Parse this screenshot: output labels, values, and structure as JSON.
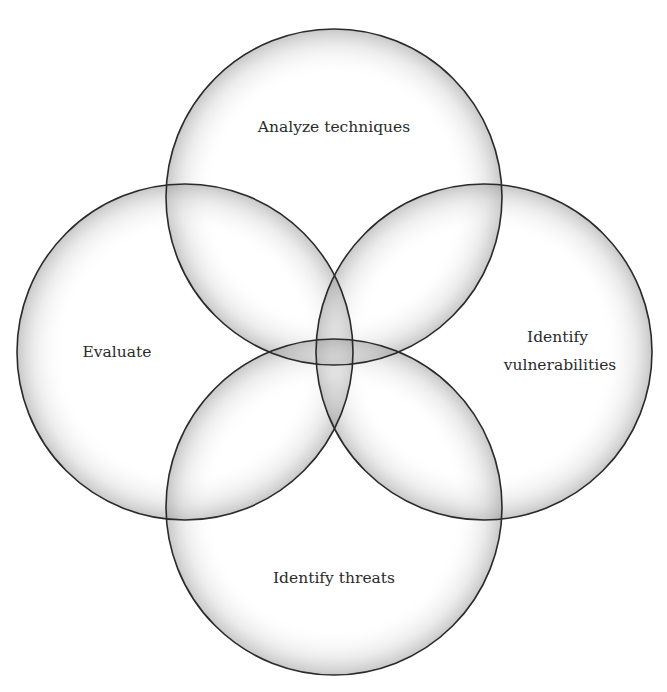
{
  "diagram": {
    "type": "venn",
    "sets": [
      {
        "id": "top",
        "label_lines": [
          "Analyze techniques"
        ]
      },
      {
        "id": "left",
        "label_lines": [
          "Evaluate"
        ]
      },
      {
        "id": "right",
        "label_lines": [
          "Identify",
          "vulnerabilities"
        ]
      },
      {
        "id": "bottom",
        "label_lines": [
          "Identify threats"
        ]
      }
    ],
    "colors": {
      "stroke": "#2a2a2a",
      "text": "#2b2b2b",
      "bubble_center": "#ffffff",
      "bubble_edge": "#bdbdbd"
    }
  }
}
